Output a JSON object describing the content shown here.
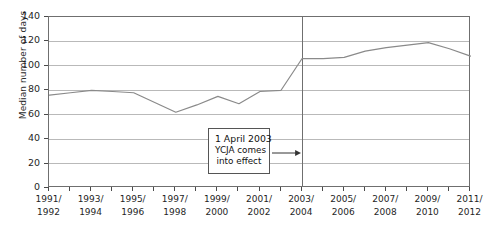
{
  "chart_data": {
    "type": "line",
    "title": "",
    "xlabel": "",
    "ylabel": "Median number of days",
    "ylim": [
      0,
      140
    ],
    "yticks": [
      0,
      20,
      40,
      60,
      80,
      100,
      120,
      140
    ],
    "grid": true,
    "legend": "none",
    "x": [
      "1991/1992",
      "1992/1993",
      "1993/1994",
      "1994/1995",
      "1995/1996",
      "1996/1997",
      "1997/1998",
      "1998/1999",
      "1999/2000",
      "2000/2001",
      "2001/2002",
      "2002/2003",
      "2003/2004",
      "2004/2005",
      "2005/2006",
      "2006/2007",
      "2007/2008",
      "2008/2009",
      "2009/2010",
      "2010/2011",
      "2011/2012"
    ],
    "xtick_labels": [
      "1991/\n1992",
      "1993/\n1994",
      "1995/\n1996",
      "1997/\n1998",
      "1999/\n2000",
      "2001/\n2002",
      "2003/\n2004",
      "2005/\n2006",
      "2007/\n2008",
      "2009/\n2010",
      "2011/\n2012"
    ],
    "xtick_labels_display": [
      {
        "top": "1991/",
        "bottom": "1992"
      },
      {
        "top": "1993/",
        "bottom": "1994"
      },
      {
        "top": "1995/",
        "bottom": "1996"
      },
      {
        "top": "1997/",
        "bottom": "1998"
      },
      {
        "top": "1999/",
        "bottom": "2000"
      },
      {
        "top": "2001/",
        "bottom": "2002"
      },
      {
        "top": "2003/",
        "bottom": "2004"
      },
      {
        "top": "2005/",
        "bottom": "2006"
      },
      {
        "top": "2007/",
        "bottom": "2008"
      },
      {
        "top": "2009/",
        "bottom": "2010"
      },
      {
        "top": "2011/",
        "bottom": "2012"
      }
    ],
    "values": [
      76,
      78,
      80,
      79,
      78,
      70,
      62,
      68,
      75,
      69,
      79,
      80,
      106,
      106,
      107,
      112,
      115,
      117,
      119,
      114,
      108
    ],
    "series": [
      {
        "name": "Median number of days",
        "color": "#8a8a8a",
        "values": [
          76,
          78,
          80,
          79,
          78,
          70,
          62,
          68,
          75,
          69,
          79,
          80,
          106,
          106,
          107,
          112,
          115,
          117,
          119,
          114,
          108
        ]
      }
    ],
    "reference_line": {
      "x": "2003/2004",
      "label": "1 April 2003 YCJA comes into effect",
      "color": "#6f6f6f"
    },
    "annotation": {
      "line1": "1 April 2003",
      "line2": "YCJA comes",
      "line3": "into effect",
      "arrow": "right-arrow-icon"
    }
  },
  "axis": {
    "y_title": "Median number of days",
    "y_labels": [
      "140",
      "120",
      "100",
      "80",
      "60",
      "40",
      "20",
      "0"
    ]
  }
}
